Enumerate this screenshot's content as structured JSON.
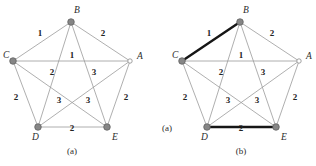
{
  "figure": {
    "background_color": "#ffffff",
    "edge_color": "#9a9a9a",
    "highlight_color": "#161616",
    "vertex_fill_color": "#868686",
    "vertex_open_color": "#ffffff"
  },
  "panels": [
    {
      "id": "panel-a",
      "caption": "(a)",
      "caption_x": 72,
      "caption_y": 154,
      "origin_x": 0,
      "vertices": [
        {
          "id": "A",
          "label": "A",
          "x": 130,
          "y": 61,
          "style": "open",
          "label_x": 137,
          "label_y": 59
        },
        {
          "id": "B",
          "label": "B",
          "x": 71,
          "y": 22,
          "style": "filled",
          "label_x": 74,
          "label_y": 13
        },
        {
          "id": "C",
          "label": "C",
          "x": 13,
          "y": 61,
          "style": "filled",
          "label_x": 3,
          "label_y": 58
        },
        {
          "id": "D",
          "label": "D",
          "x": 38,
          "y": 127,
          "style": "filled",
          "label_x": 32,
          "label_y": 140
        },
        {
          "id": "E",
          "label": "E",
          "x": 107,
          "y": 127,
          "style": "filled",
          "label_x": 112,
          "label_y": 140
        }
      ],
      "edges": [
        {
          "from": "C",
          "to": "B",
          "weight": "1",
          "label_x": 40,
          "label_y": 36,
          "highlight": false
        },
        {
          "from": "B",
          "to": "A",
          "weight": "2",
          "label_x": 103,
          "label_y": 36,
          "highlight": false
        },
        {
          "from": "C",
          "to": "A",
          "weight": "1",
          "label_x": 72,
          "label_y": 58,
          "highlight": false
        },
        {
          "from": "C",
          "to": "D",
          "weight": "2",
          "label_x": 16,
          "label_y": 100,
          "highlight": false
        },
        {
          "from": "A",
          "to": "E",
          "weight": "2",
          "label_x": 126,
          "label_y": 100,
          "highlight": false
        },
        {
          "from": "D",
          "to": "E",
          "weight": "2",
          "label_x": 72,
          "label_y": 131,
          "highlight": false
        },
        {
          "from": "B",
          "to": "D",
          "weight": "2",
          "label_x": 52,
          "label_y": 75,
          "highlight": false
        },
        {
          "from": "B",
          "to": "E",
          "weight": "3",
          "label_x": 94,
          "label_y": 75,
          "highlight": false
        },
        {
          "from": "C",
          "to": "E",
          "weight": "3",
          "label_x": 59,
          "label_y": 103,
          "highlight": false
        },
        {
          "from": "A",
          "to": "D",
          "weight": "3",
          "label_x": 88,
          "label_y": 103,
          "highlight": false
        }
      ]
    },
    {
      "id": "panel-b",
      "caption": "(b)",
      "caption_x": 241,
      "caption_y": 154,
      "side_caption": "(a)",
      "side_caption_x": 167,
      "side_caption_y": 131,
      "origin_x": 169,
      "vertices": [
        {
          "id": "A",
          "label": "A",
          "x": 299,
          "y": 61,
          "style": "open",
          "label_x": 306,
          "label_y": 59
        },
        {
          "id": "B",
          "label": "B",
          "x": 240,
          "y": 22,
          "style": "filled",
          "label_x": 243,
          "label_y": 13
        },
        {
          "id": "C",
          "label": "C",
          "x": 182,
          "y": 61,
          "style": "filled",
          "label_x": 172,
          "label_y": 58
        },
        {
          "id": "D",
          "label": "D",
          "x": 207,
          "y": 127,
          "style": "filled",
          "label_x": 201,
          "label_y": 140
        },
        {
          "id": "E",
          "label": "E",
          "x": 276,
          "y": 127,
          "style": "filled",
          "label_x": 281,
          "label_y": 140
        }
      ],
      "edges": [
        {
          "from": "C",
          "to": "B",
          "weight": "1",
          "label_x": 209,
          "label_y": 36,
          "highlight": true
        },
        {
          "from": "B",
          "to": "A",
          "weight": "2",
          "label_x": 272,
          "label_y": 36,
          "highlight": false
        },
        {
          "from": "C",
          "to": "A",
          "weight": "1",
          "label_x": 241,
          "label_y": 58,
          "highlight": false
        },
        {
          "from": "C",
          "to": "D",
          "weight": "2",
          "label_x": 185,
          "label_y": 100,
          "highlight": false
        },
        {
          "from": "A",
          "to": "E",
          "weight": "2",
          "label_x": 295,
          "label_y": 100,
          "highlight": false
        },
        {
          "from": "D",
          "to": "E",
          "weight": "2",
          "label_x": 241,
          "label_y": 131,
          "highlight": true
        },
        {
          "from": "B",
          "to": "D",
          "weight": "2",
          "label_x": 221,
          "label_y": 75,
          "highlight": false
        },
        {
          "from": "B",
          "to": "E",
          "weight": "3",
          "label_x": 263,
          "label_y": 75,
          "highlight": false
        },
        {
          "from": "C",
          "to": "E",
          "weight": "3",
          "label_x": 228,
          "label_y": 103,
          "highlight": false
        },
        {
          "from": "A",
          "to": "D",
          "weight": "3",
          "label_x": 257,
          "label_y": 103,
          "highlight": false
        }
      ]
    }
  ]
}
